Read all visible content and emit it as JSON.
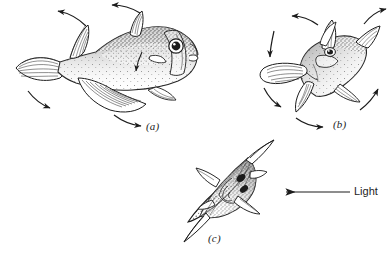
{
  "figure": {
    "type": "scientific-line-illustration",
    "background_color": "#ffffff",
    "ink_color": "#1c1c1c",
    "width": 391,
    "height": 264,
    "panels": [
      {
        "id": "a",
        "label": "(a)",
        "caption_position": {
          "x": 146,
          "y": 120
        },
        "description": "fish in normal horizontal posture viewed from the side, dorsal fin and tail raised, large pectoral fin extended, stippled body shading, motion arrows around fins"
      },
      {
        "id": "b",
        "label": "(b)",
        "caption_position": {
          "x": 333,
          "y": 118
        },
        "description": "fish tilted obliquely with fins spread outward, seen from a three-quarter angle, motion arrows radiating from each fin"
      },
      {
        "id": "c",
        "label": "(c)",
        "caption_position": {
          "x": 208,
          "y": 232
        },
        "description": "fish viewed nearly head-on at a steep diagonal, narrow body silhouette with four fins spread in a cross, facing the light source"
      }
    ],
    "light_indicator": {
      "label": "Light",
      "label_position": {
        "x": 354,
        "y": 185
      },
      "arrow_direction": "left",
      "arrow_start": {
        "x": 350,
        "y": 192
      },
      "arrow_end": {
        "x": 283,
        "y": 192
      }
    },
    "motion_arrows": {
      "count": 11,
      "style": "curved-open-head",
      "meaning": "direction of fin and body movement"
    }
  }
}
